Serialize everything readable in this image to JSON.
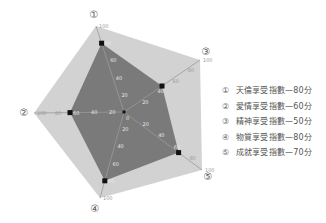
{
  "chart_data": {
    "type": "radar",
    "title": "",
    "axes": [
      {
        "id": "1",
        "marker": "①",
        "label": "天倫享受指數",
        "value": 80
      },
      {
        "id": "2",
        "marker": "②",
        "label": "愛情享受指數",
        "value": 60
      },
      {
        "id": "3",
        "marker": "③",
        "label": "精神享受指數",
        "value": 50
      },
      {
        "id": "4",
        "marker": "④",
        "label": "物質享受指數",
        "value": 80
      },
      {
        "id": "5",
        "marker": "⑤",
        "label": "成就享受指數",
        "value": 70
      }
    ],
    "range": [
      0,
      100
    ],
    "ticks": [
      0,
      20,
      40,
      60,
      80,
      100
    ],
    "unit": "分",
    "grid": false,
    "legend_position": "right"
  },
  "geometry": {
    "center": [
      124,
      112
    ],
    "outer": {
      "1": [
        96,
        26
      ],
      "3": [
        200,
        60
      ],
      "5": [
        202,
        170
      ],
      "4": [
        100,
        198
      ],
      "2": [
        34,
        113
      ]
    },
    "order": [
      "1",
      "3",
      "5",
      "4",
      "2"
    ],
    "marker_pos": {
      "1": [
        94,
        15
      ],
      "3": [
        206,
        52
      ],
      "5": [
        208,
        177
      ],
      "4": [
        95,
        209
      ],
      "2": [
        24,
        113
      ]
    }
  },
  "colors": {
    "outer_fill": "#d2d2d2",
    "data_fill": "#7a7a7a",
    "axis_line": "#999999",
    "point": "#111111",
    "tick_text": "#e6e6e6",
    "marker_text": "#555555"
  },
  "legend": {
    "items": [
      {
        "marker": "①",
        "text": "天倫享受指數—80分"
      },
      {
        "marker": "②",
        "text": "愛情享受指數—60分"
      },
      {
        "marker": "③",
        "text": "精神享受指數—50分"
      },
      {
        "marker": "④",
        "text": "物質享受指數—80分"
      },
      {
        "marker": "⑤",
        "text": "成就享受指數—70分"
      }
    ]
  }
}
